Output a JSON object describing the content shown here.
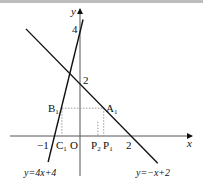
{
  "figure": {
    "axes": {
      "x_label": "x",
      "y_label": "y",
      "origin_label": "O",
      "x_ticks": [
        {
          "value": -1,
          "label": "−1"
        },
        {
          "value": 2,
          "label": "2"
        }
      ],
      "y_ticks": [
        {
          "value": 2,
          "label": "2"
        },
        {
          "value": 4,
          "label": "4"
        }
      ]
    },
    "lines": [
      {
        "id": "line1",
        "equation": "y=4x+4",
        "slope": 4,
        "intercept": 4,
        "x_range": [
          -1.25,
          0.12
        ]
      },
      {
        "id": "line2",
        "equation": "y=−x+2",
        "slope": -1,
        "intercept": 2,
        "x_range": [
          -2.12,
          3.05
        ]
      }
    ],
    "points": [
      {
        "name": "A",
        "sub": "1",
        "x": 0.93,
        "y": 1.07
      },
      {
        "name": "B",
        "sub": "1",
        "x": -0.71,
        "y": 1.07
      },
      {
        "name": "C",
        "sub": "1",
        "x": -0.71,
        "y": 0
      },
      {
        "name": "P",
        "sub": "1",
        "x": 0.93,
        "y": 0
      },
      {
        "name": "P",
        "sub": "2",
        "x": 0.7,
        "y": 0
      }
    ],
    "line_labels": {
      "line1": "y=4x+4",
      "line2": "y=−x+2"
    },
    "colors": {
      "ink": "#111111",
      "dotted": "#9a9a9a",
      "axis": "#555555",
      "border": "#bdbdbd"
    }
  }
}
